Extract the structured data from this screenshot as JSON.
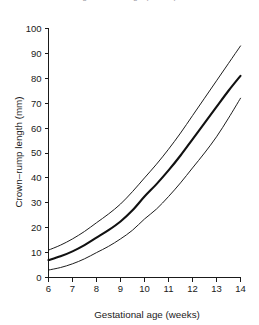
{
  "figure": {
    "caption_sliver": "gestational age (weeks)"
  },
  "chart_data": {
    "type": "line",
    "title": "",
    "xlabel": "Gestational age (weeks)",
    "ylabel": "Crown–rump length (mm)",
    "xlim": [
      6,
      14
    ],
    "ylim": [
      0,
      100
    ],
    "xticks": [
      6,
      7,
      8,
      9,
      10,
      11,
      12,
      13,
      14
    ],
    "yticks": [
      0,
      10,
      20,
      30,
      40,
      50,
      60,
      70,
      80,
      90,
      100
    ],
    "xtick_labels": [
      "6",
      "7",
      "8",
      "9",
      "10",
      "11",
      "12",
      "13",
      "14"
    ],
    "ytick_labels": [
      "0",
      "10",
      "20",
      "30",
      "40",
      "50",
      "60",
      "70",
      "80",
      "90",
      "100"
    ],
    "grid": false,
    "legend": false,
    "x": [
      6,
      6.5,
      7,
      7.5,
      8,
      8.5,
      9,
      9.5,
      10,
      10.5,
      11,
      11.5,
      12,
      12.5,
      13,
      13.5,
      14
    ],
    "series": [
      {
        "name": "Upper limit (97th centile)",
        "style": "thin",
        "values": [
          11.0,
          13.0,
          15.5,
          18.5,
          22.0,
          25.5,
          29.5,
          34.5,
          40.0,
          45.5,
          51.5,
          58.0,
          65.0,
          72.0,
          79.0,
          86.0,
          93.0
        ]
      },
      {
        "name": "Median (50th centile)",
        "style": "bold",
        "values": [
          7.0,
          8.5,
          10.5,
          13.0,
          16.0,
          19.0,
          22.5,
          27.0,
          32.5,
          37.5,
          43.0,
          49.0,
          55.5,
          62.0,
          68.5,
          75.0,
          81.0
        ]
      },
      {
        "name": "Lower limit (3rd centile)",
        "style": "thin",
        "values": [
          3.0,
          4.0,
          5.5,
          7.5,
          10.0,
          12.5,
          15.5,
          19.0,
          23.5,
          27.5,
          32.5,
          38.0,
          44.0,
          50.0,
          56.5,
          64.0,
          72.0
        ]
      }
    ]
  }
}
